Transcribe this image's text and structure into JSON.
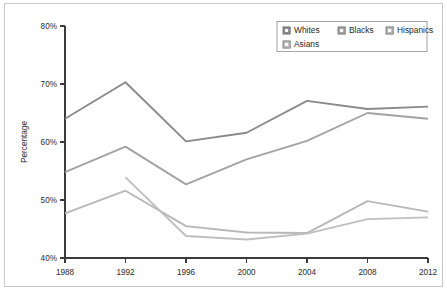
{
  "chart_data": {
    "type": "line",
    "title": "",
    "xlabel": "",
    "ylabel": "Percentage",
    "x": [
      1988,
      1992,
      1996,
      2000,
      2004,
      2008,
      2012
    ],
    "categories": [
      "1988",
      "1992",
      "1996",
      "2000",
      "2004",
      "2008",
      "2012"
    ],
    "xlim": [
      1988,
      2012
    ],
    "ylim": [
      40,
      80
    ],
    "ytick_labels": [
      "40%",
      "50%",
      "60%",
      "70%",
      "80%"
    ],
    "ytick_values": [
      40,
      50,
      60,
      70,
      80
    ],
    "grid": false,
    "legend_position": "top-right",
    "series": [
      {
        "name": "Whites",
        "color": "#8a8a8a",
        "x": [
          1988,
          1992,
          1996,
          2000,
          2004,
          2008,
          2012
        ],
        "values": [
          64.0,
          70.3,
          60.1,
          61.6,
          67.1,
          65.7,
          66.1
        ]
      },
      {
        "name": "Blacks",
        "color": "#a3a3a3",
        "x": [
          1988,
          1992,
          1996,
          2000,
          2004,
          2008,
          2012
        ],
        "values": [
          54.8,
          59.2,
          52.7,
          57.0,
          60.2,
          65.0,
          64.0
        ]
      },
      {
        "name": "Hispanics",
        "color": "#b8b8b8",
        "x": [
          1988,
          1992,
          1996,
          2000,
          2004,
          2008,
          2012
        ],
        "values": [
          47.7,
          51.6,
          45.5,
          44.4,
          44.3,
          49.8,
          48.0
        ]
      },
      {
        "name": "Asians",
        "color": "#bfbfbf",
        "x": [
          1992,
          1996,
          2000,
          2004,
          2008,
          2012
        ],
        "values": [
          53.9,
          43.8,
          43.2,
          44.2,
          46.7,
          47.0
        ]
      }
    ]
  },
  "axis": {
    "y_title": "Percentage",
    "y_ticks": [
      "80%",
      "70%",
      "60%",
      "50%",
      "40%"
    ],
    "x_ticks": [
      "1988",
      "1992",
      "1996",
      "2000",
      "2004",
      "2008",
      "2012"
    ]
  },
  "legend": {
    "items": [
      {
        "label": "Whites",
        "color": "#8a8a8a"
      },
      {
        "label": "Blacks",
        "color": "#a3a3a3"
      },
      {
        "label": "Hispanics",
        "color": "#b8b8b8"
      },
      {
        "label": "Asians",
        "color": "#bfbfbf"
      }
    ]
  }
}
